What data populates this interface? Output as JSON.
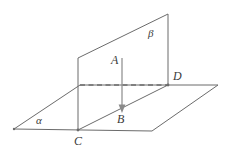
{
  "figure": {
    "width": 231,
    "height": 157,
    "background_color": "#ffffff",
    "stroke_color": "#6b6b6b",
    "label_color": "#3b3b3b"
  },
  "labels": {
    "point_a": "A",
    "point_b": "B",
    "point_c": "C",
    "point_d": "D",
    "plane_alpha": "α",
    "plane_beta": "β"
  },
  "geometry": {
    "plane_alpha": {
      "name": "horizontal-plane",
      "shape": "parallelogram",
      "points": "14,129 80,85 218,85 152,131"
    },
    "plane_beta": {
      "name": "vertical-plane",
      "shape": "parallelogram",
      "points": "78,58 168,14 168,85 78,130"
    },
    "hidden_edge": {
      "name": "hidden-intersection-edge",
      "x1": 80,
      "y1": 85,
      "x2": 168,
      "y2": 85
    },
    "segment_ab": {
      "name": "perpendicular-segment",
      "x1": 122,
      "y1": 58,
      "x2": 122,
      "y2": 112
    },
    "vertices": {
      "a": {
        "x": 122,
        "y": 58
      },
      "b": {
        "x": 122,
        "y": 112
      },
      "c": {
        "x": 78,
        "y": 130
      },
      "d": {
        "x": 168,
        "y": 85
      }
    }
  },
  "label_positions": {
    "point_a": {
      "left": 111,
      "top": 54
    },
    "point_b": {
      "left": 117,
      "top": 113
    },
    "point_c": {
      "left": 74,
      "top": 135
    },
    "point_d": {
      "left": 173,
      "top": 70
    },
    "plane_alpha": {
      "left": 36,
      "top": 115
    },
    "plane_beta": {
      "left": 148,
      "top": 28
    }
  }
}
